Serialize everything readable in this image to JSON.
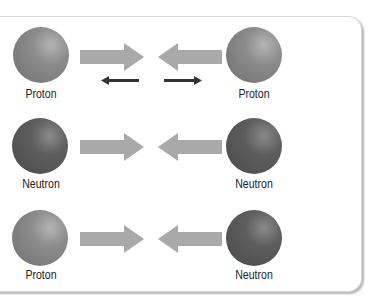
{
  "rows": [
    {
      "left": {
        "label": "Proton",
        "type": "proton"
      },
      "right": {
        "label": "Proton",
        "type": "proton"
      },
      "repulsion": true
    },
    {
      "left": {
        "label": "Neutron",
        "type": "neutron"
      },
      "right": {
        "label": "Neutron",
        "type": "neutron"
      },
      "repulsion": false
    },
    {
      "left": {
        "label": "Proton",
        "type": "proton"
      },
      "right": {
        "label": "Neutron",
        "type": "neutron"
      },
      "repulsion": false
    }
  ],
  "colors": {
    "proton": "#8a8a8a",
    "neutron": "#5a5a5a",
    "attract_arrow": "#a9a9a9",
    "repel_arrow": "#333333"
  }
}
